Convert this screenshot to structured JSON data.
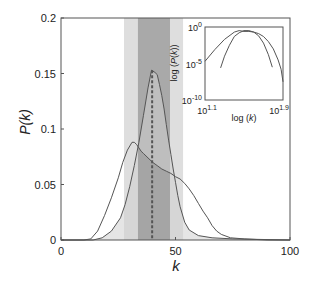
{
  "chart_data": [
    {
      "id": "main",
      "type": "line",
      "title": "",
      "xlabel": "k",
      "ylabel": "P(k)",
      "xlim": [
        0,
        100
      ],
      "ylim": [
        0,
        0.2
      ],
      "xticks": [
        0,
        50,
        100
      ],
      "xtick_labels": [
        "0",
        "50",
        "100"
      ],
      "yticks": [
        0,
        0.05,
        0.1,
        0.15,
        0.2
      ],
      "ytick_labels": [
        "0",
        "0.05",
        "0.1",
        "0.15",
        "0.2"
      ],
      "grid": false,
      "legend": null,
      "series": [
        {
          "name": "narrow distribution",
          "fill": true,
          "x": [
            0,
            14,
            18,
            22,
            26,
            28,
            30,
            32,
            34,
            36,
            38,
            39.5,
            41,
            42,
            43,
            44,
            45,
            46,
            47,
            48,
            49,
            50,
            51,
            52,
            54,
            56,
            60,
            66,
            75,
            100
          ],
          "values": [
            0,
            0,
            0.002,
            0.008,
            0.02,
            0.032,
            0.048,
            0.067,
            0.088,
            0.112,
            0.137,
            0.153,
            0.151,
            0.149,
            0.14,
            0.13,
            0.118,
            0.104,
            0.09,
            0.077,
            0.064,
            0.052,
            0.04,
            0.03,
            0.016,
            0.009,
            0.004,
            0.002,
            0.001,
            0
          ]
        },
        {
          "name": "wide distribution",
          "fill": false,
          "x": [
            0,
            10,
            13,
            16,
            19,
            22,
            25,
            27,
            29,
            31,
            32,
            33,
            34,
            35,
            36,
            38,
            40,
            42,
            44,
            46,
            48,
            50,
            52,
            54,
            56,
            58,
            60,
            62,
            64,
            66,
            68,
            70,
            74,
            80,
            90,
            100
          ],
          "values": [
            0,
            0,
            0.001,
            0.008,
            0.022,
            0.038,
            0.056,
            0.07,
            0.081,
            0.088,
            0.088,
            0.086,
            0.083,
            0.08,
            0.078,
            0.074,
            0.07,
            0.067,
            0.064,
            0.062,
            0.06,
            0.057,
            0.055,
            0.051,
            0.046,
            0.04,
            0.033,
            0.026,
            0.02,
            0.013,
            0.008,
            0.005,
            0.002,
            0.001,
            0,
            0
          ]
        }
      ],
      "annotations": [
        {
          "type": "vline",
          "x": 39.8,
          "y_top": 0.153,
          "style": "dashed"
        },
        {
          "type": "band",
          "x0": 27.5,
          "x1": 53.3,
          "shade": "light"
        },
        {
          "type": "band",
          "x0": 33.6,
          "x1": 47.6,
          "shade": "dark"
        }
      ]
    },
    {
      "id": "inset",
      "type": "line",
      "title": "",
      "xlabel": "log (k)",
      "ylabel": "log (P(k))",
      "xscale": "log",
      "yscale": "log",
      "xlim_exp": [
        1.1,
        1.9
      ],
      "ylim_exp": [
        -10,
        0
      ],
      "xtick_labels": [
        {
          "base": "10",
          "exp": "1.1"
        },
        {
          "base": "10",
          "exp": "1.9"
        }
      ],
      "ytick_labels": [
        {
          "base": "10",
          "exp": "0"
        },
        {
          "base": "10",
          "exp": "-5"
        },
        {
          "base": "10",
          "exp": "-10"
        }
      ],
      "series": [
        {
          "name": "wide distribution (log-log)",
          "x_exp": [
            1.1,
            1.2,
            1.3,
            1.4,
            1.45,
            1.5,
            1.55,
            1.6,
            1.65,
            1.7,
            1.75,
            1.8,
            1.85,
            1.88,
            1.9
          ],
          "y_exp": [
            -4.7,
            -3.1,
            -1.7,
            -0.7,
            -0.5,
            -0.6,
            -0.6,
            -0.7,
            -0.9,
            -1.3,
            -2.0,
            -3.0,
            -4.5,
            -5.8,
            -7.5
          ]
        },
        {
          "name": "narrow distribution (log-log)",
          "x_exp": [
            1.26,
            1.3,
            1.35,
            1.4,
            1.45,
            1.5,
            1.55,
            1.6,
            1.65,
            1.7,
            1.75,
            1.79
          ],
          "y_exp": [
            -5.6,
            -4.0,
            -2.5,
            -1.3,
            -0.8,
            -0.5,
            -0.5,
            -0.7,
            -1.2,
            -2.2,
            -3.8,
            -5.5
          ]
        }
      ]
    }
  ]
}
